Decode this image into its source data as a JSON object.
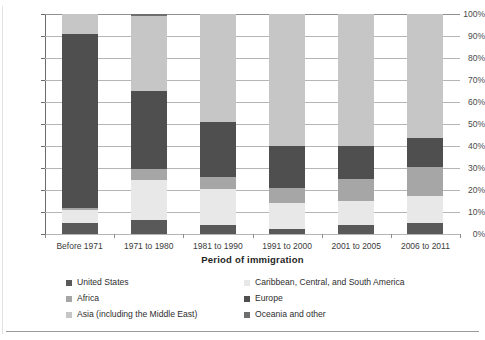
{
  "chart_data": {
    "type": "bar",
    "subtype": "stacked-100-percent",
    "title": "",
    "xlabel": "Period of immigration",
    "ylabel": "",
    "ylim": [
      0,
      100
    ],
    "ytick_labels": [
      "0%",
      "10%",
      "20%",
      "30%",
      "40%",
      "50%",
      "60%",
      "70%",
      "80%",
      "90%",
      "100%"
    ],
    "ytick_values": [
      0,
      10,
      20,
      30,
      40,
      50,
      60,
      70,
      80,
      90,
      100
    ],
    "grid": true,
    "legend_position": "bottom",
    "categories": [
      "Before 1971",
      "1971 to 1980",
      "1981 to 1990",
      "1991 to 2000",
      "2001 to 2005",
      "2006 to 2011"
    ],
    "series": [
      {
        "name": "United States",
        "color": "#595959",
        "values": [
          5.0,
          6.5,
          4.0,
          2.5,
          4.0,
          5.0
        ]
      },
      {
        "name": "Caribbean, Central, and South America",
        "color": "#e8e8e8",
        "values": [
          6.0,
          18.0,
          16.5,
          11.5,
          11.0,
          12.5
        ]
      },
      {
        "name": "Africa",
        "color": "#a6a6a6",
        "values": [
          1.0,
          5.0,
          5.5,
          7.0,
          10.0,
          13.0
        ]
      },
      {
        "name": "Europe",
        "color": "#4f4f4f",
        "values": [
          79.0,
          35.5,
          25.0,
          19.0,
          15.0,
          13.0
        ]
      },
      {
        "name": "Asia (including the Middle East)",
        "color": "#c6c6c6",
        "values": [
          9.0,
          34.0,
          49.0,
          60.0,
          60.0,
          56.5
        ]
      },
      {
        "name": "Oceania and other",
        "color": "#6e6e6e",
        "values": [
          0.0,
          1.0,
          0.0,
          0.0,
          0.0,
          0.0
        ]
      }
    ]
  },
  "axis": {
    "x_title": "Period of immigration"
  },
  "legend": {
    "rows": [
      {
        "left": "United States",
        "right": "Caribbean, Central, and South America"
      },
      {
        "left": "Africa",
        "right": "Europe"
      },
      {
        "left": "Asia (including the Middle East)",
        "right": "Oceania and other"
      }
    ]
  }
}
